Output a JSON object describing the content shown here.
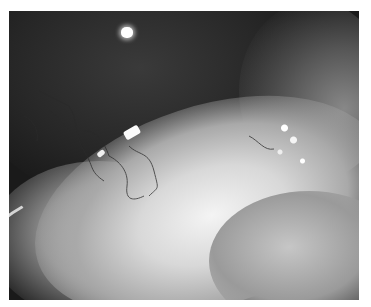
{
  "image": {
    "subject": "grayscale clinical photograph of an eye showing conjunctiva with blood vessels",
    "frame_color": "#ffffff",
    "photo_bounds": {
      "left": 9,
      "top": 11,
      "width": 350,
      "height": 289
    },
    "palette": {
      "dark": "#161616",
      "mid": "#8a8a8a",
      "bright": "#f4f4f4"
    }
  }
}
